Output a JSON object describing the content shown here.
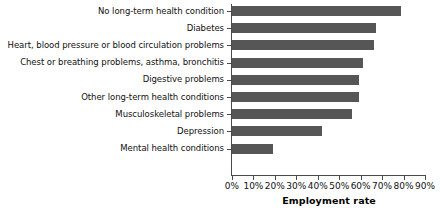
{
  "chart_data": {
    "type": "bar",
    "orientation": "horizontal",
    "title": "",
    "xlabel": "Employment rate",
    "ylabel": "",
    "xlim": [
      0,
      90
    ],
    "grid": false,
    "legend": false,
    "bar_color": "#565656",
    "axis_color": "#4a4a4a",
    "categories": [
      "No long-term health condition",
      "Diabetes",
      "Heart, blood pressure or blood circulation problems",
      "Chest or breathing problems, asthma, bronchitis",
      "Digestive problems",
      "Other long-term health conditions",
      "Musculoskeletal problems",
      "Depression",
      "Mental health conditions"
    ],
    "values": [
      79,
      67,
      66,
      61,
      59,
      59,
      56,
      42,
      19
    ],
    "value_labels": [
      "79%",
      "67%",
      "66%",
      "61%",
      "59%",
      "59%",
      "56%",
      "42%",
      "19%"
    ],
    "xticks": [
      0,
      10,
      20,
      30,
      40,
      50,
      60,
      70,
      80,
      90
    ],
    "xtick_labels": [
      "0%",
      "10%",
      "20%",
      "30%",
      "40%",
      "50%",
      "60%",
      "70%",
      "80%",
      "90%"
    ]
  }
}
